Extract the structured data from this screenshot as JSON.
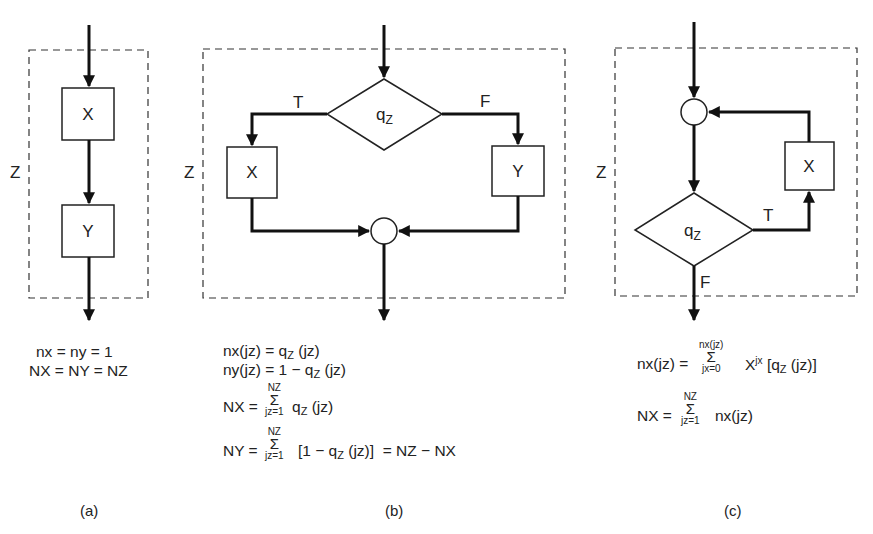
{
  "panels": {
    "a": {
      "caption": "(a)",
      "group_label": "Z",
      "boxes": [
        "X",
        "Y"
      ],
      "equations": [
        "nx = ny = 1",
        "NX = NY = NZ"
      ]
    },
    "b": {
      "caption": "(b)",
      "group_label": "Z",
      "decision": {
        "label": "q",
        "sub": "Z"
      },
      "true_label": "T",
      "false_label": "F",
      "boxes": [
        "X",
        "Y"
      ],
      "equations": {
        "eq1": {
          "lhs": "nx(jz) = q",
          "sub": "Z",
          "rhs": "(jz)"
        },
        "eq2": {
          "lhs": "ny(jz) = 1 − q",
          "sub": "Z",
          "rhs": "(jz)"
        },
        "eq3": {
          "lhs": "NX =",
          "sum_top": "NZ",
          "sum_sigma": "Σ",
          "sum_bot": "jz=1",
          "body": "q",
          "sub": "Z",
          "rhs": "(jz)"
        },
        "eq4": {
          "lhs": "NY =",
          "sum_top": "NZ",
          "sum_sigma": "Σ",
          "sum_bot": "jz=1",
          "body": "[1 − q",
          "sub": "Z",
          "rhs": "(jz)]  = NZ − NX"
        }
      }
    },
    "c": {
      "caption": "(c)",
      "group_label": "Z",
      "decision": {
        "label": "q",
        "sub": "Z"
      },
      "true_label": "T",
      "false_label": "F",
      "boxes": [
        "X"
      ],
      "equations": {
        "eq1": {
          "lhs": "nx(jz) =",
          "sum_top": "nx(jz)",
          "sum_sigma": "Σ",
          "sum_bot": "jx=0",
          "body": "X",
          "sup": "jx",
          "mid": " [q",
          "sub": "Z",
          "rhs": "(jz)]"
        },
        "eq2": {
          "lhs": "NX =",
          "sum_top": "NZ",
          "sum_sigma": "Σ",
          "sum_bot": "jz=1",
          "body": "nx(jz)"
        }
      }
    }
  },
  "colors": {
    "line": "#111111",
    "background": "#ffffff"
  }
}
